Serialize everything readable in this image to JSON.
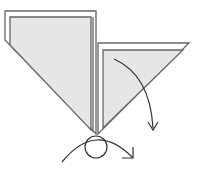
{
  "diagram": {
    "type": "origami-fold-step",
    "colors": {
      "background": "#ffffff",
      "paper_fill": "#e6e6e6",
      "line": "#666666",
      "arrow": "#333333"
    },
    "left_flap": {
      "outer_points": "5,11 96,11 96,134 5,40",
      "inner_points": "10,17 91,17 91,130 10,45"
    },
    "right_flap": {
      "outer_points": "98,43 189,43 98,134",
      "inner_points": "103,50 183,50 103,128"
    },
    "center_lines": [
      {
        "x1": 93,
        "y1": 17,
        "x2": 93,
        "y2": 132
      }
    ],
    "pivot_circle": {
      "cx": 96,
      "cy": 147,
      "r": 11
    },
    "arrows": [
      {
        "name": "fold-arrow",
        "path": "M114,59 Q150,75 153,128",
        "head": "148,122 153,130 158,122"
      },
      {
        "name": "rotate-arrow",
        "path": "M62,162 Q96,120 133,158",
        "head": "122,158 133,158 133,147"
      }
    ]
  }
}
